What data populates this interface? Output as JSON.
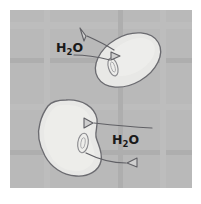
{
  "figure": {
    "panel": {
      "x": 10,
      "y": 10,
      "width": 182,
      "height": 178,
      "fill": "#b9b9b9",
      "border": "#ffffff"
    },
    "colors": {
      "background": "#ffffff",
      "panel_gray": "#b9b9b9",
      "cell_fill": "#e8e8e6",
      "cell_outline": "#6b6b70",
      "vacuole_outline": "#8a8a8e",
      "arrow_stroke": "#5f5f64",
      "text": "#1a1a1a"
    },
    "labels": [
      {
        "id": "label-water-top",
        "text": "H2O",
        "main": "H",
        "subscript": "2",
        "tail": "O",
        "x": 56,
        "y": 52
      },
      {
        "id": "label-water-bottom",
        "text": "H2O",
        "main": "H",
        "subscript": "2",
        "tail": "O",
        "x": 112,
        "y": 144
      }
    ],
    "cells": [
      {
        "id": "cell-upper",
        "shape": "ellipse",
        "description": "turgid elliptical cell, tilted",
        "cx": 128,
        "cy": 60,
        "rx": 35,
        "ry": 24,
        "rotation": -30,
        "vacuole": {
          "cx": 113,
          "cy": 67,
          "rx": 4.5,
          "ry": 9,
          "rotation": -18
        }
      },
      {
        "id": "cell-lower",
        "shape": "lobed-blob",
        "description": "swollen lobed cell",
        "cx": 69,
        "cy": 138,
        "vacuole": {
          "cx": 83,
          "cy": 143,
          "rx": 5,
          "ry": 9.5,
          "rotation": 8
        }
      }
    ],
    "arrows": [
      {
        "id": "arrow-upper-outer",
        "direction": "out",
        "from": "cell-upper-membrane",
        "to": "label-water-top",
        "path": "M 113,49 C 103,44 92,40 82,36",
        "head_at": [
          78,
          34
        ],
        "head_angle": -158
      },
      {
        "id": "arrow-upper-inner",
        "direction": "out",
        "from": "cell-upper-vacuole",
        "to": "left",
        "path": "M 112,60 C 100,58 88,56 76,55",
        "head_at": [
          116,
          58
        ],
        "head_angle": 20
      },
      {
        "id": "arrow-lower-upper",
        "direction": "in",
        "from": "right",
        "to": "cell-lower-membrane",
        "path": "M 148,127 C 130,126 112,124 98,124",
        "head_at": [
          76,
          122
        ],
        "head_angle": 185
      },
      {
        "id": "arrow-lower-lower",
        "direction": "out",
        "from": "cell-lower-vacuole",
        "to": "right",
        "path": "M 84,152 C 98,159 110,162 122,162",
        "head_at": [
          126,
          162
        ],
        "head_angle": 10
      }
    ]
  }
}
